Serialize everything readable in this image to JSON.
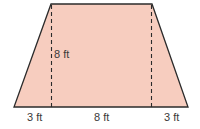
{
  "diagram": {
    "shape": "trapezoid",
    "fill_color": "#F7CDBF",
    "stroke_color": "#2b2b2b",
    "labels": {
      "height": "8 ft",
      "bottom_left": "3 ft",
      "bottom_middle": "8 ft",
      "bottom_right": "3 ft"
    }
  }
}
